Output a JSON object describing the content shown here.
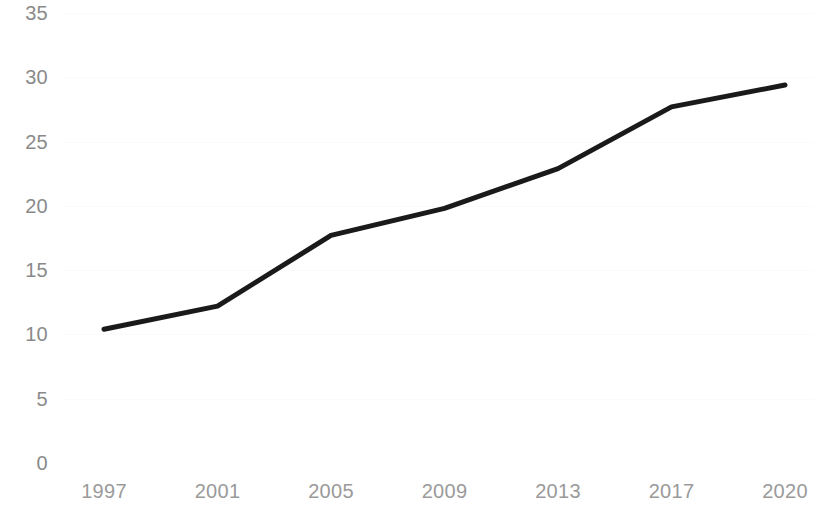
{
  "chart_data": {
    "type": "line",
    "title": "",
    "subtitle": "",
    "xlabel": "",
    "ylabel": "",
    "categories": [
      "1997",
      "2001",
      "2005",
      "2009",
      "2013",
      "2017",
      "2020"
    ],
    "x": [
      1997,
      2001,
      2005,
      2009,
      2013,
      2017,
      2020
    ],
    "values": [
      10.4,
      12.2,
      17.7,
      19.8,
      22.9,
      27.7,
      29.4
    ],
    "series": [
      {
        "name": "",
        "values": [
          10.4,
          12.2,
          17.7,
          19.8,
          22.9,
          27.7,
          29.4
        ],
        "color": "#1a1a1a",
        "line_width": 5
      }
    ],
    "ylim": [
      0,
      35
    ],
    "yticks": [
      0,
      5,
      10,
      15,
      20,
      25,
      30,
      35
    ],
    "ytick_labels": [
      "0",
      "5",
      "10",
      "15",
      "20",
      "25",
      "30",
      "35"
    ],
    "xtick_labels": [
      "1997",
      "2001",
      "2005",
      "2009",
      "2013",
      "2017",
      "2020"
    ],
    "grid": true,
    "grid_color": "#fbfbfb",
    "legend": false,
    "legend_position": "none",
    "annotations": [],
    "axis_label_color": "#8a8a8a",
    "background_color": "#ffffff"
  },
  "geometry": {
    "plot_left": 104,
    "plot_right": 785,
    "y_zero_px": 463,
    "y_max_px": 13,
    "y_max_value": 35
  }
}
